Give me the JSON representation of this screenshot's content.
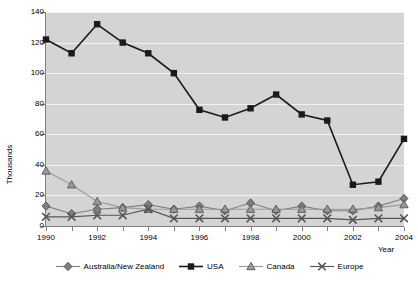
{
  "chart_data": {
    "type": "line",
    "title": "",
    "xlabel": "Year",
    "ylabel": "Thousands",
    "x": [
      1990,
      1991,
      1992,
      1993,
      1994,
      1995,
      1996,
      1997,
      1998,
      1999,
      2000,
      2001,
      2002,
      2003,
      2004
    ],
    "xtick_labels": [
      "1990",
      "1992",
      "1994",
      "1996",
      "1998",
      "2000",
      "2002",
      "2004"
    ],
    "xtick_values": [
      1990,
      1992,
      1994,
      1996,
      1998,
      2000,
      2002,
      2004
    ],
    "ylim": [
      0,
      140
    ],
    "ytick_labels": [
      "0",
      "20",
      "40",
      "60",
      "80",
      "100",
      "120",
      "140"
    ],
    "ytick_values": [
      0,
      20,
      40,
      60,
      80,
      100,
      120,
      140
    ],
    "xlim": [
      1990,
      2004
    ],
    "grid": "horizontal",
    "legend_position": "bottom",
    "plot_background": "#d4d4d4",
    "gridline_color": "#f2f2f2",
    "series": [
      {
        "name": "Australia/New Zealand",
        "marker": "diamond",
        "color": "#808080",
        "values": [
          13,
          8,
          11,
          12,
          14,
          11,
          13,
          10,
          15,
          10,
          13,
          10,
          10,
          13,
          18
        ]
      },
      {
        "name": "USA",
        "marker": "square",
        "color": "#1a1a1a",
        "values": [
          122,
          113,
          132,
          120,
          113,
          100,
          76,
          71,
          77,
          86,
          73,
          69,
          27,
          29,
          57
        ]
      },
      {
        "name": "Canada",
        "marker": "triangle",
        "color": "#999999",
        "values": [
          36,
          27,
          16,
          12,
          11,
          11,
          11,
          11,
          11,
          11,
          11,
          11,
          11,
          12,
          14
        ]
      },
      {
        "name": "Europe",
        "marker": "cross",
        "color": "#555555",
        "values": [
          6,
          6,
          7,
          7,
          11,
          5,
          5,
          5,
          5,
          5,
          5,
          5,
          4,
          5,
          5
        ]
      }
    ]
  }
}
